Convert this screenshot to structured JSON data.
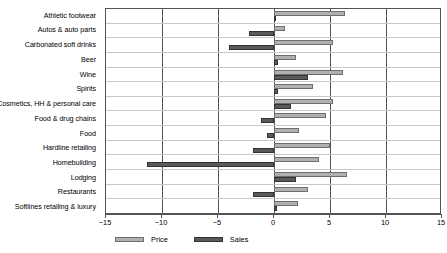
{
  "chart_data": {
    "type": "bar",
    "orientation": "horizontal",
    "title": "",
    "subtitle": "",
    "xlabel": "",
    "ylabel": "",
    "xlim": [
      -15,
      15
    ],
    "xticks": [
      -15,
      -10,
      -5,
      0,
      5,
      10,
      15
    ],
    "xtick_labels": [
      "−15",
      "−10",
      "−5",
      "0",
      "5",
      "10",
      "15"
    ],
    "grid": "vertical-and-horizontal",
    "legend_position": "bottom-left",
    "categories": [
      "Athletic footwear",
      "Autos & auto parts",
      "Carbonated soft drinks",
      "Beer",
      "Wine",
      "Spirits",
      "Cosmetics, HH & personal care",
      "Food & drug chains",
      "Food",
      "Hardline  retailing",
      "Homebuilding",
      "Lodging",
      "Restaurants",
      "Softlines retailing & luxury"
    ],
    "series": [
      {
        "name": "Price",
        "color": "#b0b0b0",
        "values": [
          6.3,
          1.0,
          5.3,
          2.0,
          6.2,
          3.5,
          5.3,
          4.6,
          2.2,
          5.0,
          4.0,
          6.5,
          3.0,
          2.1
        ]
      },
      {
        "name": "Sales",
        "color": "#595959",
        "values": [
          0.0,
          -2.2,
          -4.0,
          0.4,
          3.0,
          0.4,
          1.5,
          -1.2,
          -0.6,
          -1.9,
          -11.3,
          2.0,
          -1.9,
          0.3
        ]
      }
    ]
  },
  "legend": {
    "entries": [
      {
        "label": "Price",
        "swatch": "price"
      },
      {
        "label": "Sales",
        "swatch": "sales"
      }
    ]
  }
}
